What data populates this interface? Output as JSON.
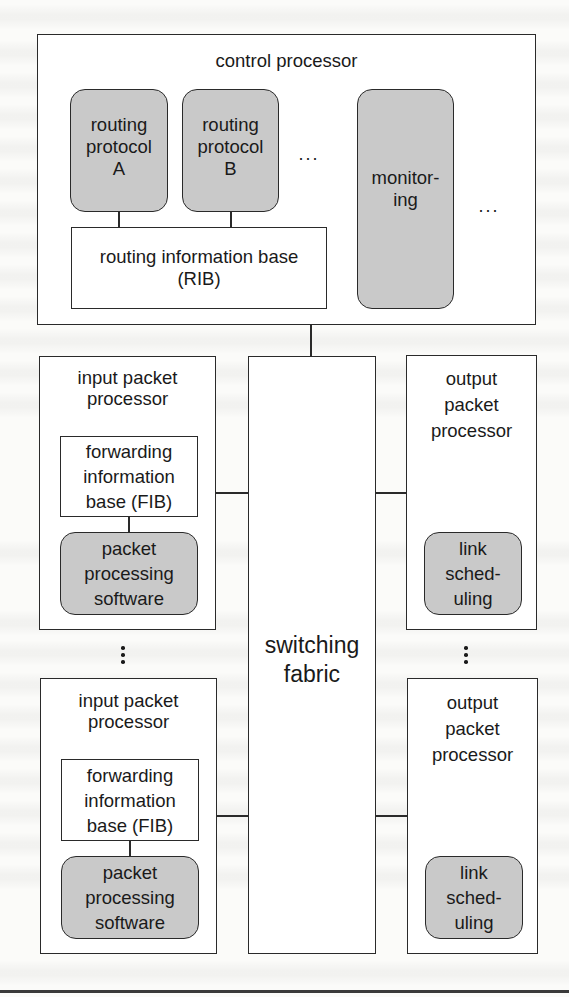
{
  "diagram": {
    "type": "router-architecture",
    "control_processor": {
      "title": "control processor",
      "routing_protocols": [
        {
          "label": "routing\nprotocol\nA"
        },
        {
          "label": "routing\nprotocol\nB"
        }
      ],
      "protocols_ellipsis": "···",
      "rib": {
        "label": "routing information base\n(RIB)"
      },
      "monitoring": {
        "label": "monitor-\ning"
      },
      "more_ellipsis": "···"
    },
    "input_packet_processors": [
      {
        "title": "input packet\nprocessor",
        "fib": {
          "label": "forwarding\ninformation\nbase (FIB)"
        },
        "software": {
          "label": "packet\nprocessing\nsoftware"
        }
      },
      {
        "title": "input packet\nprocessor",
        "fib": {
          "label": "forwarding\ninformation\nbase (FIB)"
        },
        "software": {
          "label": "packet\nprocessing\nsoftware"
        }
      }
    ],
    "switching_fabric": {
      "label": "switching\nfabric"
    },
    "output_packet_processors": [
      {
        "title": "output\npacket\nprocessor",
        "scheduler": {
          "label": "link\nsched-\nuling"
        }
      },
      {
        "title": "output\npacket\nprocessor",
        "scheduler": {
          "label": "link\nsched-\nuling"
        }
      }
    ],
    "colors": {
      "line": "#2a2a2a",
      "shaded_box": "#c9c9c9",
      "plain_box": "#ffffff",
      "page": "#fbfbf9"
    }
  }
}
